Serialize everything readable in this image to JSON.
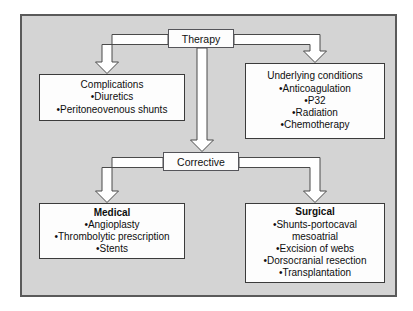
{
  "diagram": {
    "palette": {
      "panel_background": "#d4d4d4",
      "panel_border": "#5a5a5a",
      "box_fill": "#fdfdfd",
      "box_border": "#3b3b3b",
      "arrow_fill": "#ffffff",
      "arrow_stroke": "#4a4a4a",
      "text": "#0e0e0e",
      "page_background": "#ffffff"
    },
    "nodes": {
      "therapy": {
        "label": "Therapy"
      },
      "corrective": {
        "label": "Corrective"
      }
    },
    "boxes": {
      "complications": {
        "heading": "Complications",
        "items": [
          "•Diuretics",
          "•Peritoneovenous shunts"
        ]
      },
      "underlying": {
        "heading": "Underlying conditions",
        "items": [
          "•Anticoagulation",
          "•P32",
          "•Radiation",
          "•Chemotherapy"
        ]
      },
      "medical": {
        "heading": "Medical",
        "items": [
          "•Angioplasty",
          "•Thrombolytic prescription",
          "•Stents"
        ]
      },
      "surgical": {
        "heading": "Surgical",
        "items": [
          "•Shunts-portocaval",
          "mesoatrial",
          "•Excision of webs",
          "•Dorsocranial resection",
          "•Transplantation"
        ]
      }
    },
    "connectors": [
      {
        "name": "therapy-to-complications",
        "from": "therapy",
        "to": "complications",
        "shape": "elbow-left-down"
      },
      {
        "name": "therapy-to-underlying",
        "from": "therapy",
        "to": "underlying",
        "shape": "elbow-right-down"
      },
      {
        "name": "therapy-to-corrective",
        "from": "therapy",
        "to": "corrective",
        "shape": "straight-down"
      },
      {
        "name": "corrective-to-medical",
        "from": "corrective",
        "to": "medical",
        "shape": "elbow-left-down"
      },
      {
        "name": "corrective-to-surgical",
        "from": "corrective",
        "to": "surgical",
        "shape": "elbow-right-down"
      }
    ]
  }
}
